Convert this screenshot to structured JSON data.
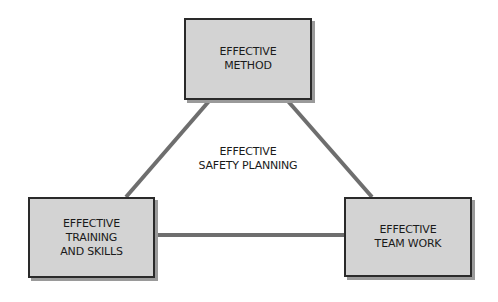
{
  "diagram": {
    "center": {
      "lines": [
        "EFFECTIVE",
        "SAFETY PLANNING"
      ]
    },
    "nodes": [
      {
        "id": "top",
        "lines": [
          "EFFECTIVE",
          "METHOD"
        ]
      },
      {
        "id": "left",
        "lines": [
          "EFFECTIVE",
          "TRAINING",
          "AND SKILLS"
        ]
      },
      {
        "id": "right",
        "lines": [
          "EFFECTIVE",
          "TEAM WORK"
        ]
      }
    ],
    "edges": [
      {
        "from": "top",
        "to": "left"
      },
      {
        "from": "top",
        "to": "right"
      },
      {
        "from": "left",
        "to": "right"
      }
    ],
    "colors": {
      "box_fill": "#d3d3d3",
      "box_border": "#2a2a2a",
      "connector": "#6e6e6e",
      "shadow": "#9a9a9a"
    }
  }
}
